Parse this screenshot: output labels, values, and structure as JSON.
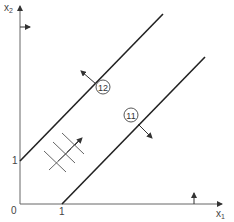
{
  "diagram": {
    "axes": {
      "x_label": "x",
      "x_sub": "1",
      "y_label": "x",
      "y_sub": "2",
      "origin_label": "0",
      "x_tick_label": "1",
      "y_tick_label": "1"
    },
    "lines": [
      {
        "id": "12",
        "label": "12",
        "from": [
          0,
          1
        ],
        "direction": "slope 1",
        "normal_arrow": "up-left"
      },
      {
        "id": "11",
        "label": "11",
        "from": [
          1,
          0
        ],
        "direction": "slope 1",
        "normal_arrow": "down-right"
      }
    ],
    "annotations": {
      "y_axis_arrow": "right-pointing arrow on x2 axis",
      "x_axis_arrow": "up-pointing arrow on x1 axis",
      "hatched_region": "grid hatch with up-right arrow between the lines"
    },
    "colors": {
      "line": "#222222",
      "axis": "#555555",
      "text": "#444444"
    }
  }
}
